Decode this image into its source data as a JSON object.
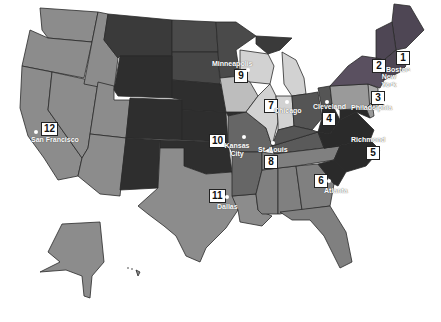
{
  "map": {
    "title": "Federal Reserve Districts",
    "colors": {
      "light_gray": "#8c8c8c",
      "lightest": "#d4d4d4",
      "mid": "#6e6e6e",
      "mid_dark": "#555555",
      "dark": "#3e3e3e",
      "darkest": "#2c2c2c",
      "pink_gray": "#9a8a92",
      "background": "#ffffff"
    },
    "districts": [
      {
        "number": "1",
        "city": "Boston"
      },
      {
        "number": "2",
        "city": "New York"
      },
      {
        "number": "3",
        "city": "Philadelphia"
      },
      {
        "number": "4",
        "city": "Cleveland"
      },
      {
        "number": "5",
        "city": "Richmond"
      },
      {
        "number": "6",
        "city": "Atlanta"
      },
      {
        "number": "7",
        "city": "Chicago"
      },
      {
        "number": "8",
        "city": "St. Louis"
      },
      {
        "number": "9",
        "city": "Minneapolis"
      },
      {
        "number": "10",
        "city": "Kansas City"
      },
      {
        "number": "11",
        "city": "Dallas"
      },
      {
        "number": "12",
        "city": "San Francisco"
      }
    ]
  }
}
